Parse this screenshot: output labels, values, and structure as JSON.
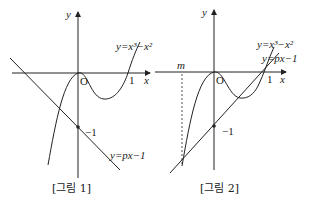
{
  "figures": [
    {
      "caption": "[그림 1]",
      "axis_x_label": "x",
      "axis_y_label": "y",
      "origin_label": "O",
      "x_tick_label": "1",
      "y_tick_label": "−1",
      "curve_label": "y=x³−x²",
      "line_label": "y=px−1"
    },
    {
      "caption": "[그림 2]",
      "axis_x_label": "x",
      "axis_y_label": "y",
      "origin_label": "O",
      "x_tick_label": "1",
      "y_tick_label": "−1",
      "curve_label": "y=x³−x²",
      "line_label": "y=px−1",
      "m_label": "m"
    }
  ],
  "colors": {
    "stroke": "#222222",
    "background": "#ffffff"
  }
}
